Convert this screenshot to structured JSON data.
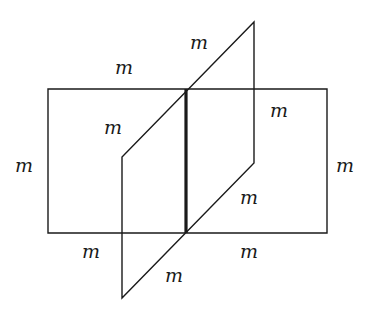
{
  "figure": {
    "name": "two-intersecting-planes-diagram",
    "stroke_color": "#1a1a1a",
    "background_color": "#ffffff",
    "thin_stroke_width": 1.4,
    "bold_stroke_width": 3.2,
    "shapes": {
      "rectangle": {
        "name": "horizontal-plane-rectangle",
        "points": "48,89 327,89 327,233 48,233"
      },
      "parallelogram": {
        "name": "tilted-plane-parallelogram",
        "points": "254,22 254,163 122,298 122,157"
      },
      "intersection_segment": {
        "name": "intersection-line",
        "x1": 186,
        "y1": 89,
        "x2": 186,
        "y2": 233
      },
      "diagonal_upper": {
        "name": "parallelogram-upper-diagonal-edge",
        "x1": 122,
        "y1": 157,
        "x2": 254,
        "y2": 22
      },
      "diagonal_lower": {
        "name": "parallelogram-lower-diagonal-edge",
        "x1": 122,
        "y1": 298,
        "x2": 254,
        "y2": 163
      }
    },
    "labels": [
      {
        "name": "label-parallelogram-top",
        "text": "m",
        "x": 190,
        "y": 33
      },
      {
        "name": "label-rectangle-top-left",
        "text": "m",
        "x": 115,
        "y": 58
      },
      {
        "name": "label-parallelogram-upper-inner",
        "text": "m",
        "x": 104,
        "y": 118
      },
      {
        "name": "label-parallelogram-right-upper",
        "text": "m",
        "x": 270,
        "y": 101
      },
      {
        "name": "label-rectangle-left",
        "text": "m",
        "x": 15,
        "y": 156
      },
      {
        "name": "label-rectangle-right",
        "text": "m",
        "x": 336,
        "y": 156
      },
      {
        "name": "label-parallelogram-right-lower",
        "text": "m",
        "x": 240,
        "y": 188
      },
      {
        "name": "label-rectangle-bottom-left",
        "text": "m",
        "x": 82,
        "y": 242
      },
      {
        "name": "label-rectangle-bottom-right",
        "text": "m",
        "x": 240,
        "y": 242
      },
      {
        "name": "label-parallelogram-bottom",
        "text": "m",
        "x": 165,
        "y": 266
      }
    ]
  }
}
